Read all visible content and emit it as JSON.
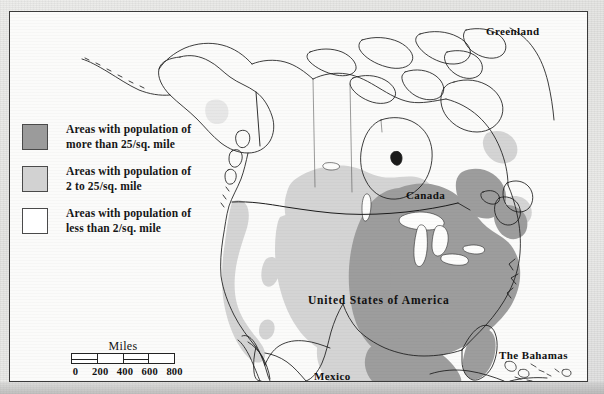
{
  "map": {
    "title": "Population density of North America",
    "legend": {
      "items": [
        {
          "swatch": "dark-gray",
          "color": "#9b9b9b",
          "line1": "Areas with population of",
          "line2": "more than 25/sq. mile"
        },
        {
          "swatch": "light-gray",
          "color": "#d2d2d2",
          "line1": "Areas with population of",
          "line2": "2 to 25/sq. mile"
        },
        {
          "swatch": "white",
          "color": "#ffffff",
          "line1": "Areas with population of",
          "line2": "less than 2/sq. mile"
        }
      ]
    },
    "scalebar": {
      "title": "Miles",
      "labels": [
        "0",
        "200",
        "400",
        "600",
        "800"
      ],
      "segments": 4,
      "segment_miles": 200,
      "max_miles": 800
    },
    "labels": {
      "greenland": "Greenland",
      "canada": "Canada",
      "usa": "United States of America",
      "mexico": "Mexico",
      "bahamas": "The Bahamas"
    },
    "colors": {
      "high_density": "#9b9b9b",
      "medium_density": "#d2d2d2",
      "low_density": "#ffffff",
      "coastline": "#1b1b1b",
      "border_line": "#2a2a2a",
      "frame": "#3a3a3a",
      "paper": "#e9e9e7"
    }
  }
}
